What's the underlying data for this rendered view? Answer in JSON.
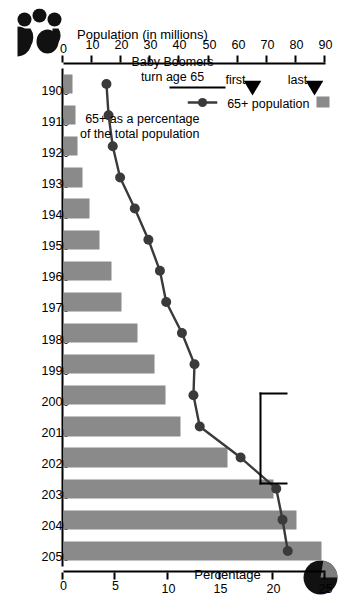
{
  "chart_data": {
    "type": "bar",
    "title": "",
    "x": [
      1900,
      1910,
      1920,
      1930,
      1940,
      1950,
      1960,
      1970,
      1980,
      1990,
      2000,
      2010,
      2020,
      2030,
      2040,
      2050
    ],
    "categories": [
      "1900",
      "1910",
      "1920",
      "1930",
      "1940",
      "1950",
      "1960",
      "1970",
      "1980",
      "1990",
      "2000",
      "2010",
      "2020",
      "2030",
      "2040",
      "2050"
    ],
    "series": [
      {
        "name": "65+ population",
        "kind": "bar",
        "unit": "millions",
        "axis": "left",
        "values": [
          3.1,
          4.0,
          4.9,
          6.6,
          9.0,
          12.3,
          16.6,
          20.1,
          25.5,
          31.2,
          35.0,
          40.2,
          56.4,
          72.1,
          80.0,
          88.5
        ]
      },
      {
        "name": "65+ as a percentage of the total population",
        "kind": "line",
        "unit": "percent",
        "axis": "right",
        "values": [
          4.1,
          4.3,
          4.7,
          5.4,
          6.8,
          8.1,
          9.2,
          9.8,
          11.3,
          12.5,
          12.4,
          13.0,
          16.9,
          20.3,
          20.9,
          21.4
        ]
      }
    ],
    "xlabel": "",
    "ylabel": "Population  (in millions)",
    "y2label": "Percentage",
    "ylim": [
      0,
      90
    ],
    "y2lim": [
      0,
      25
    ],
    "yticks": [
      0,
      10,
      20,
      30,
      40,
      50,
      60,
      70,
      80,
      90
    ],
    "y2ticks": [
      0,
      5,
      10,
      15,
      20,
      25
    ],
    "grid": false,
    "legend_position": "left-middle",
    "annotations": [
      {
        "name": "baby-boomers-bracket",
        "text": "Baby Boomers\nturn age 65",
        "from": 2011,
        "to": 2029
      },
      {
        "name": "first-marker",
        "text": "first",
        "year": 2010
      },
      {
        "name": "last-marker",
        "text": "last",
        "year": 2030
      }
    ]
  },
  "axes": {
    "population": {
      "title_line1": "Population",
      "title_line2": "(in millions)",
      "title_full": "Population  (in millions)",
      "ticks": [
        "0",
        "10",
        "20",
        "30",
        "40",
        "50",
        "60",
        "70",
        "80",
        "90"
      ]
    },
    "percentage": {
      "title": "Percentage",
      "ticks": [
        "0",
        "5",
        "10",
        "15",
        "20",
        "25"
      ]
    },
    "years": {
      "ticks": [
        "1900",
        "1910",
        "1920",
        "1930",
        "1940",
        "1950",
        "1960",
        "1970",
        "1980",
        "1990",
        "2000",
        "2010",
        "2020",
        "2030",
        "2040",
        "2050"
      ]
    }
  },
  "legend": {
    "items": [
      {
        "name": "legend-bar",
        "label": "65+ population",
        "symbol": "filled-rectangle",
        "color": "#8a8a8a"
      },
      {
        "name": "legend-line",
        "label_line1": "65+ as a percentage",
        "label_line2": "of the total population",
        "label_full": "65+ as a percentage of the total population",
        "symbol": "line-with-dot-marker",
        "color": "#3a3a3a"
      }
    ]
  },
  "annotations": {
    "boomers_line1": "Baby Boomers",
    "boomers_line2": "turn age 65",
    "first": "first",
    "last": "last"
  },
  "icons": {
    "pie": {
      "name": "pie-chart-icon",
      "fill": "#111111",
      "wedge": "#7d7d7d"
    },
    "people": {
      "name": "people-group-icon",
      "fill": "#111111"
    }
  },
  "colors": {
    "bar": "#8a8a8a",
    "line": "#3a3a3a",
    "axis": "#000000",
    "background": "#ffffff"
  }
}
